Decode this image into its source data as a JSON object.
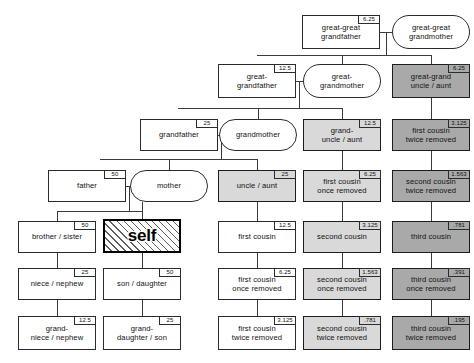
{
  "chart": {
    "colors": {
      "background": "#ffffff",
      "line": "#3a3a3a",
      "border": "#2b2b2b",
      "fill_white": "#ffffff",
      "fill_light_gray": "#d9d9d9",
      "fill_dark_gray": "#a9a9a9",
      "self_border": "#000000"
    },
    "badge_unit": "percent"
  },
  "nodes": [
    {
      "id": "great-great-grandfather",
      "label": "great-great\ngrandfather",
      "badge": "6.25",
      "shape": "box",
      "fill": "white",
      "x": 302,
      "y": 15,
      "w": 78,
      "h": 34
    },
    {
      "id": "great-great-grandmother",
      "label": "great-great\ngrandmother",
      "badge": "",
      "shape": "oval",
      "fill": "white",
      "x": 392,
      "y": 15,
      "w": 78,
      "h": 34
    },
    {
      "id": "great-grandfather",
      "label": "great-\ngrandfather",
      "badge": "12.5",
      "shape": "box",
      "fill": "white",
      "x": 218,
      "y": 64,
      "w": 78,
      "h": 34
    },
    {
      "id": "great-grandmother",
      "label": "great-\ngrandmother",
      "badge": "",
      "shape": "oval",
      "fill": "white",
      "x": 303,
      "y": 64,
      "w": 78,
      "h": 34
    },
    {
      "id": "great-grand-uncle-aunt",
      "label": "great-grand\nuncle / aunt",
      "badge": "6.25",
      "shape": "box",
      "fill": "dark",
      "x": 392,
      "y": 64,
      "w": 78,
      "h": 34
    },
    {
      "id": "grandfather",
      "label": "grandfather",
      "badge": "25",
      "shape": "box",
      "fill": "white",
      "x": 140,
      "y": 119,
      "w": 78,
      "h": 32
    },
    {
      "id": "grandmother",
      "label": "grandmother",
      "badge": "",
      "shape": "oval",
      "fill": "white",
      "x": 219,
      "y": 119,
      "w": 78,
      "h": 32
    },
    {
      "id": "grand-uncle-aunt",
      "label": "grand-\nuncle / aunt",
      "badge": "12.5",
      "shape": "box",
      "fill": "light",
      "x": 303,
      "y": 119,
      "w": 78,
      "h": 32
    },
    {
      "id": "first-cousin-twice-removed-r1",
      "label": "first cousin\ntwice removed",
      "badge": "3.125",
      "shape": "box",
      "fill": "dark",
      "x": 392,
      "y": 119,
      "w": 78,
      "h": 32
    },
    {
      "id": "father",
      "label": "father",
      "badge": "50",
      "shape": "box",
      "fill": "white",
      "x": 48,
      "y": 170,
      "w": 78,
      "h": 32
    },
    {
      "id": "mother",
      "label": "mother",
      "badge": "",
      "shape": "oval",
      "fill": "white",
      "x": 130,
      "y": 170,
      "w": 78,
      "h": 32
    },
    {
      "id": "uncle-aunt",
      "label": "uncle / aunt",
      "badge": "25",
      "shape": "box",
      "fill": "light",
      "x": 218,
      "y": 170,
      "w": 78,
      "h": 32
    },
    {
      "id": "first-cousin-once-removed-r2",
      "label": "first cousin\nonce removed",
      "badge": "6.25",
      "shape": "box",
      "fill": "light",
      "x": 303,
      "y": 170,
      "w": 78,
      "h": 32
    },
    {
      "id": "second-cousin-twice-removed-r2",
      "label": "second cousin\ntwice removed",
      "badge": "1.563",
      "shape": "box",
      "fill": "dark",
      "x": 392,
      "y": 170,
      "w": 78,
      "h": 32
    },
    {
      "id": "brother-sister",
      "label": "brother / sister",
      "badge": "50",
      "shape": "box",
      "fill": "white",
      "x": 18,
      "y": 221,
      "w": 78,
      "h": 32
    },
    {
      "id": "self",
      "label": "self",
      "badge": "",
      "shape": "self",
      "fill": "white",
      "x": 103,
      "y": 219,
      "w": 78,
      "h": 34
    },
    {
      "id": "first-cousin",
      "label": "first cousin",
      "badge": "12.5",
      "shape": "box",
      "fill": "white",
      "x": 218,
      "y": 221,
      "w": 78,
      "h": 32
    },
    {
      "id": "second-cousin",
      "label": "second cousin",
      "badge": "3.125",
      "shape": "box",
      "fill": "light",
      "x": 303,
      "y": 221,
      "w": 78,
      "h": 32
    },
    {
      "id": "third-cousin",
      "label": "third cousin",
      "badge": ".781",
      "shape": "box",
      "fill": "dark",
      "x": 392,
      "y": 221,
      "w": 78,
      "h": 32
    },
    {
      "id": "niece-nephew",
      "label": "niece / nephew",
      "badge": "25",
      "shape": "box",
      "fill": "white",
      "x": 18,
      "y": 268,
      "w": 78,
      "h": 32
    },
    {
      "id": "son-daughter",
      "label": "son / daughter",
      "badge": "50",
      "shape": "box",
      "fill": "white",
      "x": 103,
      "y": 268,
      "w": 78,
      "h": 32
    },
    {
      "id": "first-cousin-once-removed",
      "label": "first cousin\nonce removed",
      "badge": "6.25",
      "shape": "box",
      "fill": "white",
      "x": 218,
      "y": 268,
      "w": 78,
      "h": 32
    },
    {
      "id": "second-cousin-once-removed",
      "label": "second cousin\nonce removed",
      "badge": "1.563",
      "shape": "box",
      "fill": "light",
      "x": 303,
      "y": 268,
      "w": 78,
      "h": 32
    },
    {
      "id": "third-cousin-once-removed",
      "label": "third cousin\nonce removed",
      "badge": ".391",
      "shape": "box",
      "fill": "dark",
      "x": 392,
      "y": 268,
      "w": 78,
      "h": 32
    },
    {
      "id": "grand-niece-nephew",
      "label": "grand-\nniece / nephew",
      "badge": "12.5",
      "shape": "box",
      "fill": "white",
      "x": 18,
      "y": 316,
      "w": 78,
      "h": 34
    },
    {
      "id": "grand-daughter-son",
      "label": "grand-\ndaughter / son",
      "badge": "25",
      "shape": "box",
      "fill": "white",
      "x": 103,
      "y": 316,
      "w": 78,
      "h": 34
    },
    {
      "id": "first-cousin-twice-removed",
      "label": "first cousin\ntwice removed",
      "badge": "3.125",
      "shape": "box",
      "fill": "white",
      "x": 218,
      "y": 316,
      "w": 78,
      "h": 34
    },
    {
      "id": "second-cousin-twice-removed",
      "label": "second cousin\ntwice removed",
      "badge": ".781",
      "shape": "box",
      "fill": "light",
      "x": 303,
      "y": 316,
      "w": 78,
      "h": 34
    },
    {
      "id": "third-cousin-twice-removed",
      "label": "third cousin\ntwice removed",
      "badge": ".195",
      "shape": "box",
      "fill": "dark",
      "x": 392,
      "y": 316,
      "w": 78,
      "h": 34
    }
  ],
  "connectors": [
    {
      "id": "ggg-couple-link",
      "o": "h",
      "x": 380,
      "y": 32,
      "len": 12
    },
    {
      "id": "ggg-drop",
      "o": "v",
      "x": 386,
      "y": 32,
      "len": 17
    },
    {
      "id": "ggg-sib-bar",
      "o": "h",
      "x": 257,
      "y": 55,
      "len": 174
    },
    {
      "id": "ggg-sib-up",
      "o": "v",
      "x": 386,
      "y": 49,
      "len": 6
    },
    {
      "id": "ggm-down",
      "o": "v",
      "x": 342,
      "y": 55,
      "len": 9
    },
    {
      "id": "ggu-down",
      "o": "v",
      "x": 431,
      "y": 55,
      "len": 9
    },
    {
      "id": "gg-couple-link",
      "o": "h",
      "x": 296,
      "y": 81,
      "len": 8
    },
    {
      "id": "gg-drop",
      "o": "v",
      "x": 299,
      "y": 81,
      "len": 22
    },
    {
      "id": "gg-sib-bar",
      "o": "h",
      "x": 178,
      "y": 108,
      "len": 164
    },
    {
      "id": "gg-sib-up",
      "o": "v",
      "x": 299,
      "y": 103,
      "len": 5
    },
    {
      "id": "gm-down",
      "o": "v",
      "x": 258,
      "y": 108,
      "len": 11
    },
    {
      "id": "gu-down",
      "o": "v",
      "x": 342,
      "y": 108,
      "len": 11
    },
    {
      "id": "g-couple-link",
      "o": "h",
      "x": 218,
      "y": 135,
      "len": 6
    },
    {
      "id": "g-drop",
      "o": "v",
      "x": 221,
      "y": 135,
      "len": 24
    },
    {
      "id": "g-sib-bar",
      "o": "h",
      "x": 100,
      "y": 159,
      "len": 158
    },
    {
      "id": "g-sib-up",
      "o": "v",
      "x": 221,
      "y": 155,
      "len": 5
    },
    {
      "id": "mo-down",
      "o": "v",
      "x": 169,
      "y": 159,
      "len": 11
    },
    {
      "id": "un-down",
      "o": "v",
      "x": 257,
      "y": 159,
      "len": 11
    },
    {
      "id": "p-couple-link",
      "o": "h",
      "x": 126,
      "y": 186,
      "len": 6
    },
    {
      "id": "p-drop",
      "o": "v",
      "x": 129,
      "y": 186,
      "len": 25
    },
    {
      "id": "p-sib-bar",
      "o": "h",
      "x": 57,
      "y": 211,
      "len": 86
    },
    {
      "id": "self-up",
      "o": "v",
      "x": 142,
      "y": 202,
      "len": 17
    },
    {
      "id": "bro-down",
      "o": "v",
      "x": 57,
      "y": 211,
      "len": 10
    },
    {
      "id": "self-to-son",
      "o": "v",
      "x": 142,
      "y": 253,
      "len": 15
    },
    {
      "id": "bro-to-niece",
      "o": "v",
      "x": 57,
      "y": 253,
      "len": 15
    },
    {
      "id": "niece-to-gniece",
      "o": "v",
      "x": 57,
      "y": 300,
      "len": 16
    },
    {
      "id": "son-to-gdaughter",
      "o": "v",
      "x": 142,
      "y": 300,
      "len": 16
    },
    {
      "id": "un-to-c1",
      "o": "v",
      "x": 257,
      "y": 202,
      "len": 19
    },
    {
      "id": "c1-to-c1or",
      "o": "v",
      "x": 257,
      "y": 253,
      "len": 15
    },
    {
      "id": "c1or-to-c1tr",
      "o": "v",
      "x": 257,
      "y": 300,
      "len": 16
    },
    {
      "id": "gu-to-c1or",
      "o": "v",
      "x": 342,
      "y": 151,
      "len": 19
    },
    {
      "id": "c1or-to-c2",
      "o": "v",
      "x": 342,
      "y": 202,
      "len": 19
    },
    {
      "id": "c2-to-c2or",
      "o": "v",
      "x": 342,
      "y": 253,
      "len": 15
    },
    {
      "id": "c2or-to-c2tr",
      "o": "v",
      "x": 342,
      "y": 300,
      "len": 16
    },
    {
      "id": "ggu-to-c1tr",
      "o": "v",
      "x": 431,
      "y": 98,
      "len": 21
    },
    {
      "id": "c1tr-to-c2tr",
      "o": "v",
      "x": 431,
      "y": 151,
      "len": 19
    },
    {
      "id": "c2tr-to-c3",
      "o": "v",
      "x": 431,
      "y": 202,
      "len": 19
    },
    {
      "id": "c3-to-c3or",
      "o": "v",
      "x": 431,
      "y": 253,
      "len": 15
    },
    {
      "id": "c3or-to-c3tr",
      "o": "v",
      "x": 431,
      "y": 300,
      "len": 16
    }
  ]
}
